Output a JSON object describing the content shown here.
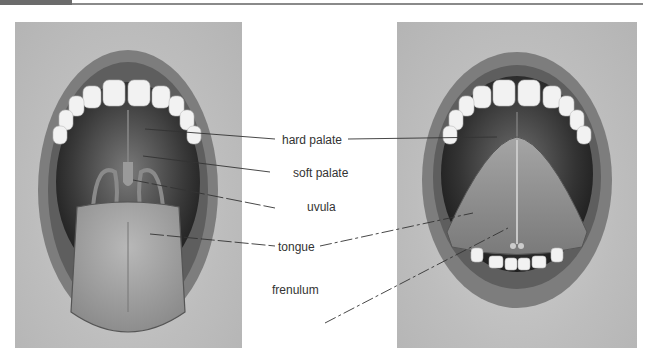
{
  "figure": {
    "type": "anatomical-illustration",
    "panels": [
      {
        "id": "left",
        "view": "mouth open, tongue extended"
      },
      {
        "id": "right",
        "view": "mouth open, tongue raised showing underside"
      }
    ],
    "labels": {
      "hard_palate": "hard palate",
      "soft_palate": "soft palate",
      "uvula": "uvula",
      "tongue": "tongue",
      "frenulum": "frenulum"
    }
  },
  "colors": {
    "header_block": "#6b6b6b",
    "header_rule": "#8a8a8a",
    "label_text": "#333333",
    "leader_line": "#333333"
  }
}
